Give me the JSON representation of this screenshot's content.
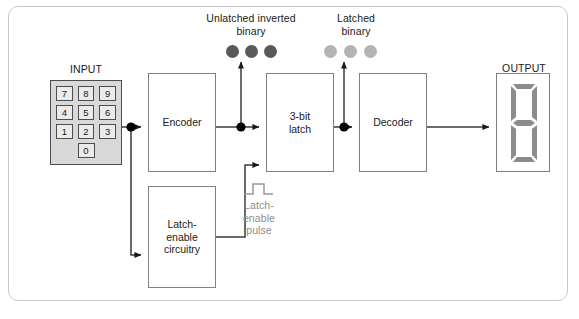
{
  "diagram": {
    "frame_color": "#c9c9c9",
    "background": "#ffffff"
  },
  "input": {
    "label": "INPUT",
    "panel_color": "#d9d9d9",
    "key_color": "#ebebeb",
    "keys": [
      [
        "7",
        "8",
        "9"
      ],
      [
        "4",
        "5",
        "6"
      ],
      [
        "1",
        "2",
        "3"
      ],
      [
        "0"
      ]
    ]
  },
  "blocks": {
    "encoder": {
      "label": "Encoder"
    },
    "latch": {
      "label": "3-bit\nlatch"
    },
    "decoder": {
      "label": "Decoder"
    },
    "latch_enable_circuitry": {
      "label": "Latch-\nenable\ncircuitry"
    }
  },
  "signals": {
    "unlatched_inverted_binary": {
      "label": "Unlatched inverted\nbinary",
      "dot_color": "#595959",
      "dot_count": 3
    },
    "latched_binary": {
      "label": "Latched\nbinary",
      "dot_color": "#b3b3b3",
      "dot_count": 3
    },
    "latch_enable_pulse": {
      "label": "Latch-\nenable\npulse",
      "text_color": "#8c8c8c",
      "waveform_color": "#999999",
      "waveform": "pulse"
    }
  },
  "output": {
    "label": "OUTPUT",
    "display_type": "seven-segment",
    "segment_color": "#8c8c8c",
    "segments_lit": [
      "a",
      "b",
      "c",
      "d",
      "e",
      "f",
      "g"
    ],
    "shown_character": "8"
  },
  "wires": {
    "line_color": "#3a3a3a",
    "junction_color": "#000000",
    "junctions": 3
  }
}
